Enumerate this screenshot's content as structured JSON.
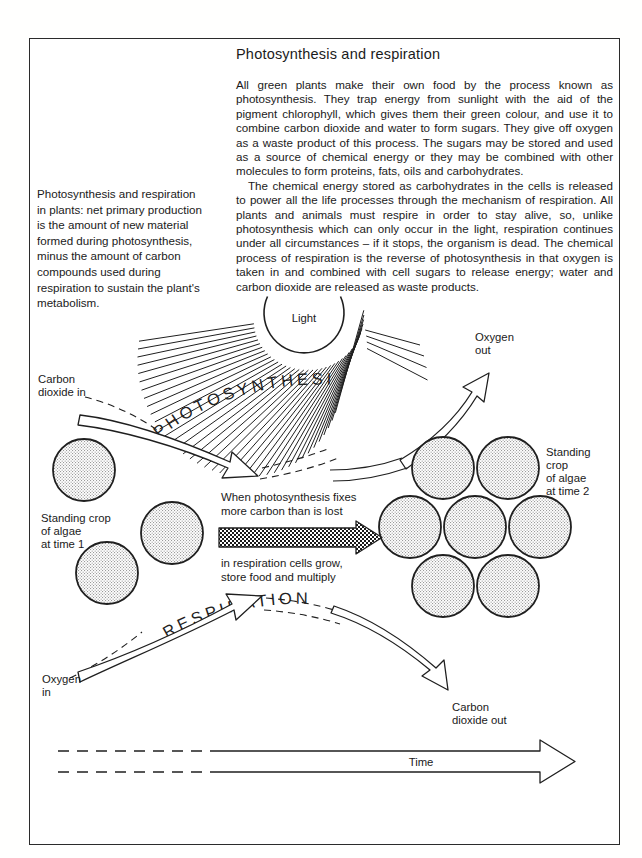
{
  "figure": {
    "title": "Photosynthesis and respiration",
    "body_paragraphs": [
      "All green plants make their own food by the process known as photosynthesis. They trap energy from sunlight with the aid of the pigment chlorophyll, which gives them their green colour, and use it to combine carbon dioxide and water to form sugars. They give off oxygen as a waste product of this process. The sugars may be stored and used as a source of chemical energy or they may be combined with other molecules to form proteins, fats, oils and carbohydrates.",
      "The chemical energy stored as carbohydrates in the cells is released to power all the life processes through the mechanism of respiration. All plants and animals must respire in order to stay alive, so, unlike photosynthesis which can only occur in the light, respiration continues under all circumstances – if it stops, the organism is dead. The chemical process of respiration is the reverse of photosynthesis in that oxygen is taken in and combined with cell sugars to release energy; water and carbon dioxide are released as waste products."
    ],
    "caption": "Photosynthesis and respiration in plants: net primary production is the amount of new material formed during photosynthesis, minus the amount of carbon compounds used during respiration to sustain the plant's metabolism."
  },
  "diagram": {
    "sun_label": "Light",
    "process_photosynthesis": "PHOTOSYNTHESIS",
    "process_respiration": "RESPIRATION",
    "carbon_dioxide_in": [
      "Carbon",
      "dioxide in"
    ],
    "oxygen_out": [
      "Oxygen",
      "out"
    ],
    "oxygen_in": [
      "Oxygen",
      "in"
    ],
    "carbon_dioxide_out": [
      "Carbon",
      "dioxide out"
    ],
    "standing_crop_time1": [
      "Standing crop",
      "of algae",
      "at time 1"
    ],
    "standing_crop_time2": [
      "Standing",
      "crop",
      "of algae",
      "at time 2"
    ],
    "growth_note_above": [
      "When photosynthesis fixes",
      "more carbon than is lost"
    ],
    "growth_note_below": [
      "in respiration cells grow,",
      "store food and multiply"
    ],
    "time_axis_label": "Time",
    "algae_count_time1": 3,
    "algae_count_time2": 7
  },
  "colors": {
    "ink": "#1a1a1a",
    "frame": "#2b2b2b",
    "stipple_fill": "#e9e9e9",
    "paper": "#ffffff"
  }
}
